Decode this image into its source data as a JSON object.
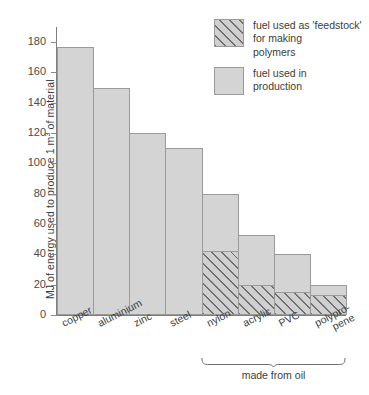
{
  "chart_data": {
    "type": "bar",
    "title": "",
    "subtitle": "",
    "xlabel": "",
    "ylabel": "MJ of energy used to produce 1 m3 of material",
    "ylabel_parts": {
      "before": "MJ of energy used to produce 1 m",
      "superscript": "3",
      "after": " of material"
    },
    "ylim": [
      0,
      190
    ],
    "yticks": [
      0,
      20,
      40,
      60,
      80,
      100,
      120,
      140,
      160,
      180
    ],
    "ytick_labels": [
      "0",
      "20",
      "40",
      "60",
      "80",
      "100",
      "120",
      "140",
      "160",
      "180"
    ],
    "grid": false,
    "stacked": true,
    "categories": [
      "copper",
      "aluminium",
      "zinc",
      "steel",
      "nylon",
      "acrylic",
      "PVC",
      "polypro-pene"
    ],
    "category_labels": [
      {
        "line1": "copper",
        "line2": ""
      },
      {
        "line1": "aluminium",
        "line2": ""
      },
      {
        "line1": "zinc",
        "line2": ""
      },
      {
        "line1": "steel",
        "line2": ""
      },
      {
        "line1": "nylon",
        "line2": ""
      },
      {
        "line1": "acrylic",
        "line2": ""
      },
      {
        "line1": "PVC",
        "line2": ""
      },
      {
        "line1": "polypro-",
        "line2": "pene"
      }
    ],
    "series": [
      {
        "name": "fuel used in production",
        "color": "#d4d4d4",
        "values": [
          177,
          150,
          120,
          110,
          38,
          33,
          25,
          7
        ]
      },
      {
        "name": "fuel used as 'feedstock' for making polymers",
        "color": "#d0d0d0",
        "hatched": true,
        "values": [
          0,
          0,
          0,
          0,
          42,
          20,
          15,
          13
        ]
      }
    ],
    "totals": [
      177,
      150,
      120,
      110,
      80,
      53,
      40,
      20
    ],
    "annotations": [
      {
        "text": "made from oil",
        "spans": [
          "nylon",
          "acrylic",
          "PVC",
          "polypro-pene"
        ],
        "style": "brace"
      }
    ],
    "legend": {
      "position": "top-right",
      "entries": [
        {
          "label_line1": "fuel used as 'feedstock'",
          "label_line2": "for making",
          "label_line3": "polymers",
          "swatch": "hatched"
        },
        {
          "label_line1": "fuel used in",
          "label_line2": "production",
          "label_line3": "",
          "swatch": "solid"
        }
      ]
    },
    "colors": {
      "bar_fill": "#d4d4d4",
      "bar_stroke": "#9a9a9a",
      "hatch_line": "#6f6f6f",
      "axis": "#7d7d7d",
      "text": "#3c3c3c",
      "background": "#ffffff"
    }
  }
}
